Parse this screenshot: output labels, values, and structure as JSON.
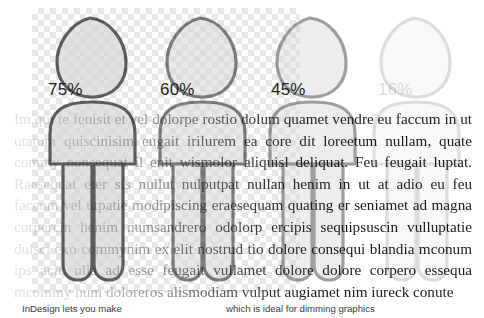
{
  "canvas": {
    "transparency_checker": "checkerboard-transparency-grid",
    "checker_light": "#ffffff",
    "checker_dark": "#e7e7e7",
    "background": "#ffffff"
  },
  "figures": [
    {
      "name": "person-pictogram-75",
      "opacity_label": "75%",
      "opacity": 0.75
    },
    {
      "name": "person-pictogram-60",
      "opacity_label": "60%",
      "opacity": 0.6
    },
    {
      "name": "person-pictogram-45",
      "opacity_label": "45%",
      "opacity": 0.45
    },
    {
      "name": "person-pictogram-16",
      "opacity_label": "16%",
      "opacity": 0.16
    }
  ],
  "body_copy": {
    "text": "Im qui te feuisit et vel dolorpe rostio dolum quamet vendre eu faccum in ut utatum quiscinisim eugait irilurem ea core dit loreetum nullam, quate commy nonsequat il enit wismolor aliquisl deliquat. Feu feugait luptat. Raesequat eter sis nullut nulputpat nullan henim in ut at adio eu feu faccum vel utpatie modipiscing eraesequam quating er seniamet ad magna corpercin henim numsandrero odolorp ercipis sequipsuscin vulluptatie dulsci exo commynim ex elit nostrud tio dolore consequi blandia mconum ips acin ulla ad esse feugait vullamet dolore dolore corpero essequa mcommy num doloreros alismodiam vulput augiamet nim iureck conute"
  },
  "captions": {
    "left": "InDesign lets you make",
    "right": "which is ideal for dimming graphics"
  }
}
